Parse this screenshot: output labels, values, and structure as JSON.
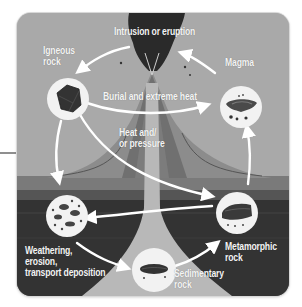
{
  "diagram": {
    "colors": {
      "sky": "#a9a9a9",
      "volcano_light": "#8c8c8c",
      "volcano_dark": "#6e6e6e",
      "ground_top": "#5e5e5e",
      "ground_deep": "#2f2f2f",
      "conduit": "#b8b8b8",
      "arrow": "#ffffff",
      "node_fill": "#f2f2f2",
      "rock": "#3a3a3a"
    },
    "labels": {
      "intrusion": "Intrusion or eruption",
      "igneous": "Igneous\nrock",
      "magma": "Magma",
      "burial": "Burial and extreme heat",
      "heat_pressure": "Heat and/\nor pressure",
      "weathering": "Weathering,\nerosion,\ntransport deposition",
      "sedimentary": "Sedimentary\nrock",
      "metamorphic": "Metamorphic\nrock"
    },
    "nodes": [
      {
        "id": "igneous-rock",
        "icon": "igneous-rock-icon"
      },
      {
        "id": "magma",
        "icon": "magma-icon"
      },
      {
        "id": "sediments",
        "icon": "sediment-particles-icon"
      },
      {
        "id": "metamorphic-rock",
        "icon": "metamorphic-rock-icon"
      },
      {
        "id": "sedimentary-rock",
        "icon": "sedimentary-rock-icon"
      }
    ],
    "arrows": [
      {
        "from": "magma",
        "to": "igneous-rock",
        "label": "Intrusion or eruption"
      },
      {
        "from": "igneous-rock",
        "to": "magma",
        "label": "Burial and extreme heat"
      },
      {
        "from": "igneous-rock",
        "to": "metamorphic-rock",
        "label": "Heat and/or pressure"
      },
      {
        "from": "igneous-rock",
        "to": "sediments"
      },
      {
        "from": "metamorphic-rock",
        "to": "magma"
      },
      {
        "from": "metamorphic-rock",
        "to": "sediments"
      },
      {
        "from": "sediments",
        "to": "sedimentary-rock",
        "label": "Weathering, erosion, transport deposition"
      },
      {
        "from": "sedimentary-rock",
        "to": "metamorphic-rock"
      }
    ]
  }
}
